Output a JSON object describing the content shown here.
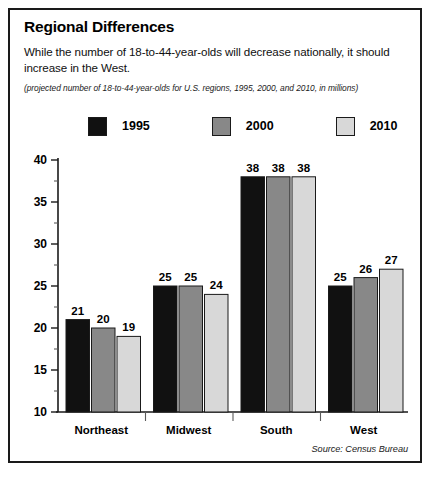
{
  "figure": {
    "title": "Regional Differences",
    "subtitle": "While the number of 18-to-44-year-olds will decrease nationally, it should increase in the West.",
    "note": "(projected number of 18-to-44-year-olds for U.S. regions, 1995, 2000, and 2010, in millions)",
    "source": "Source: Census Bureau"
  },
  "legend": {
    "position": "top",
    "items": [
      {
        "label": "1995",
        "color": "#111111"
      },
      {
        "label": "2000",
        "color": "#888888"
      },
      {
        "label": "2010",
        "color": "#d8d8d8"
      }
    ]
  },
  "axes": {
    "y_ticks": [
      "40",
      "35",
      "30",
      "25",
      "20",
      "15",
      "10"
    ],
    "x_ticks": [
      "Northeast",
      "Midwest",
      "South",
      "West"
    ]
  },
  "chart_data": {
    "type": "bar",
    "title": "Regional Differences",
    "subtitle": "(projected number of 18-to-44-year-olds for U.S. regions, 1995, 2000, and 2010, in millions)",
    "xlabel": "",
    "ylabel": "",
    "ylim": [
      10,
      40
    ],
    "ytick_step": 5,
    "grid": false,
    "legend_position": "top",
    "categories": [
      "Northeast",
      "Midwest",
      "South",
      "West"
    ],
    "series": [
      {
        "name": "1995",
        "color": "#111111",
        "values": [
          21,
          25,
          38,
          25
        ]
      },
      {
        "name": "2000",
        "color": "#888888",
        "values": [
          20,
          25,
          38,
          26
        ]
      },
      {
        "name": "2010",
        "color": "#d8d8d8",
        "values": [
          19,
          24,
          38,
          27
        ]
      }
    ],
    "data_labels": [
      [
        "21",
        "20",
        "19"
      ],
      [
        "25",
        "25",
        "24"
      ],
      [
        "38",
        "38",
        "38"
      ],
      [
        "25",
        "26",
        "27"
      ]
    ]
  }
}
